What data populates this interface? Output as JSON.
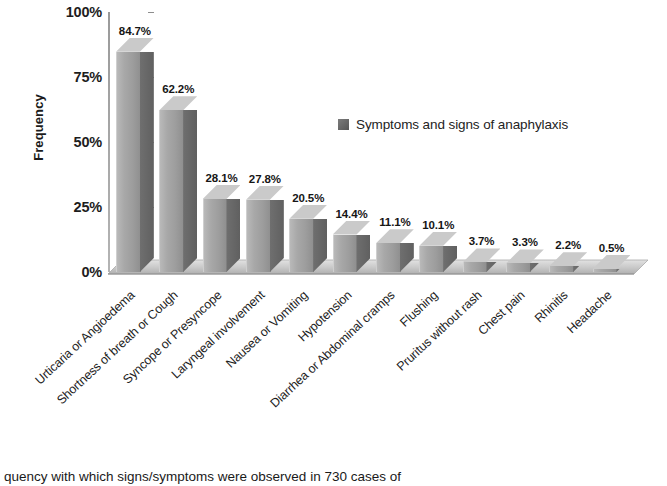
{
  "chart_data": {
    "type": "bar",
    "title": "",
    "xlabel": "",
    "ylabel": "Frequency",
    "ylim": [
      0,
      100
    ],
    "grid": false,
    "legend_position": "inside-upper-right",
    "categories": [
      "Urticaria or Angioedema",
      "Shortness of breath or Cough",
      "Syncope or Presyncope",
      "Laryngeal involvement",
      "Nausea or Vomiting",
      "Hypotension",
      "Diarrhea or Abdominal cramps",
      "Flushing",
      "Pruritus without rash",
      "Chest pain",
      "Rhinitis",
      "Headache"
    ],
    "values": [
      84.7,
      62.2,
      28.1,
      27.8,
      20.5,
      14.4,
      11.1,
      10.1,
      3.7,
      3.3,
      2.2,
      0.5
    ],
    "data_labels": [
      "84.7%",
      "62.2%",
      "28.1%",
      "27.8%",
      "20.5%",
      "14.4%",
      "11.1%",
      "10.1%",
      "3.7%",
      "3.3%",
      "2.2%",
      "0.5%"
    ],
    "ytick_labels": [
      "0%",
      "25%",
      "50%",
      "75%",
      "100%"
    ],
    "ytick_values": [
      0,
      25,
      50,
      75,
      100
    ],
    "series": [
      {
        "name": "Symptoms and signs of anaphylaxis",
        "values": [
          84.7,
          62.2,
          28.1,
          27.8,
          20.5,
          14.4,
          11.1,
          10.1,
          3.7,
          3.3,
          2.2,
          0.5
        ]
      }
    ]
  },
  "legend": {
    "entry_label": "Symptoms and signs of anaphylaxis"
  },
  "axis": {
    "y_title": "Frequency"
  },
  "caption": {
    "text": "quency with which signs/symptoms were observed in 730 cases of"
  },
  "colors": {
    "bar_front": "#a5a5a5",
    "bar_side": "#686868",
    "bar_top": "#cacaca",
    "legend_swatch": "#6a6a6a",
    "axis": "#9a9a9a",
    "text": "#1a1a1a",
    "background": "#ffffff"
  }
}
